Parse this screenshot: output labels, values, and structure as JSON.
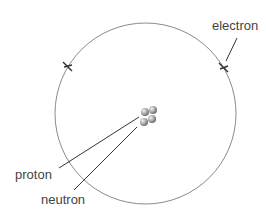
{
  "diagram": {
    "labels": {
      "electron": "electron",
      "proton": "proton",
      "neutron": "neutron"
    },
    "electron_count": 2,
    "nucleus_particle_count": 4,
    "colors": {
      "orbit": "#8a8a8a",
      "line": "#333333",
      "text": "#444444",
      "particle": "#9a9a9a"
    }
  }
}
